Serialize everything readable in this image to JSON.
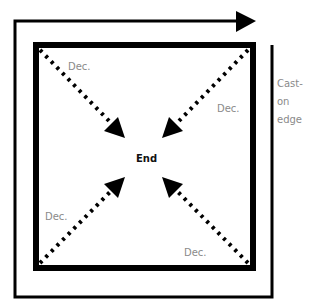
{
  "diagram": {
    "center_label": "End",
    "edge_label": [
      "Cast-",
      "on",
      "edge"
    ],
    "decrease_labels": [
      "Dec.",
      "Dec.",
      "Dec.",
      "Dec."
    ],
    "colors": {
      "line": "#000000",
      "label": "#8a8a8a",
      "background": "#ffffff"
    }
  }
}
